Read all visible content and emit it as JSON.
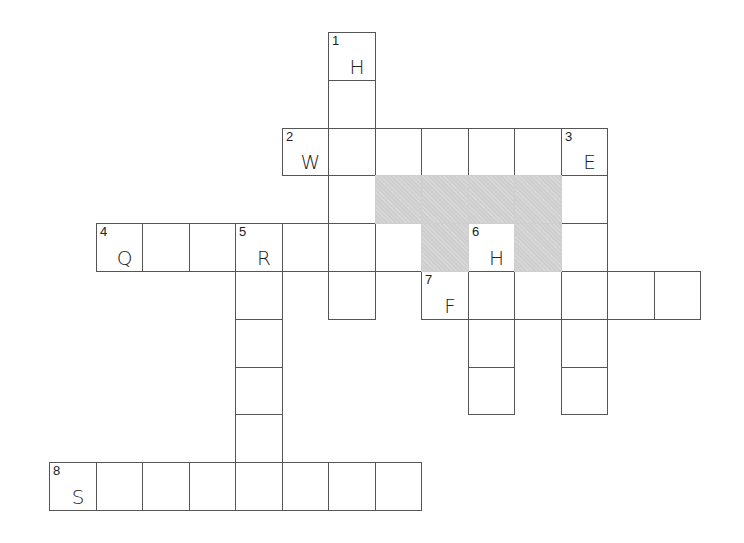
{
  "puzzle": {
    "type": "crossword",
    "grid": {
      "origin_x": 49,
      "origin_y": 32,
      "cell_w": 46.5,
      "cell_h": 47.8,
      "cols": 14,
      "rows": 10,
      "line_color": "#555555",
      "shade_color": "#cfcfcf"
    },
    "words": [
      {
        "number": 1,
        "direction": "down",
        "row": 0,
        "col": 6,
        "length": 6,
        "given_letter": "H"
      },
      {
        "number": 2,
        "direction": "across",
        "row": 2,
        "col": 5,
        "length": 7,
        "given_letter": "W"
      },
      {
        "number": 3,
        "direction": "down",
        "row": 2,
        "col": 11,
        "length": 6,
        "given_letter": "E"
      },
      {
        "number": 4,
        "direction": "across",
        "row": 4,
        "col": 1,
        "length": 7,
        "given_letter": "Q"
      },
      {
        "number": 5,
        "direction": "down",
        "row": 4,
        "col": 4,
        "length": 6,
        "given_letter": "R"
      },
      {
        "number": 6,
        "direction": "down",
        "row": 4,
        "col": 9,
        "length": 4,
        "given_letter": "H"
      },
      {
        "number": 7,
        "direction": "across",
        "row": 5,
        "col": 8,
        "length": 6,
        "given_letter": "F"
      },
      {
        "number": 8,
        "direction": "across",
        "row": 9,
        "col": 0,
        "length": 8,
        "given_letter": "S"
      }
    ],
    "shaded_cells": [
      {
        "row": 3,
        "col": 7
      },
      {
        "row": 3,
        "col": 8
      },
      {
        "row": 3,
        "col": 9
      },
      {
        "row": 3,
        "col": 10
      },
      {
        "row": 4,
        "col": 8
      },
      {
        "row": 4,
        "col": 10
      }
    ]
  }
}
